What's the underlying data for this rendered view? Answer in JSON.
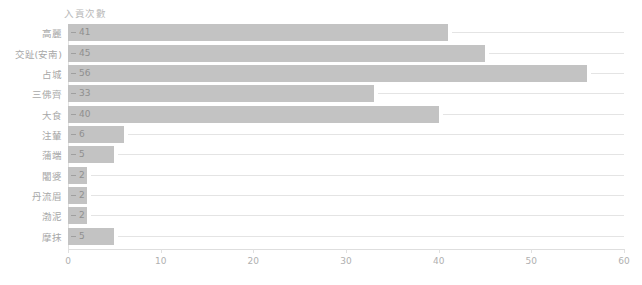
{
  "chart_data": {
    "type": "bar",
    "orientation": "horizontal",
    "title": "入貢次數",
    "xlabel": "",
    "ylabel": "",
    "xlim": [
      0,
      60
    ],
    "xticks": [
      0,
      10,
      20,
      30,
      40,
      50,
      60
    ],
    "grid": false,
    "legend": null,
    "bar_color": "#c3c3c3",
    "text_color": "#a8a8a8",
    "background": "#ffffff",
    "categories": [
      "高麗",
      "交趾(安南)",
      "占城",
      "三佛齊",
      "大食",
      "注輦",
      "蒲端",
      "闍婆",
      "丹流眉",
      "渤泥",
      "摩抹"
    ],
    "values": [
      41,
      45,
      56,
      33,
      40,
      6,
      5,
      2,
      2,
      2,
      5
    ],
    "labels": [
      "41",
      "45",
      "56",
      "33",
      "40",
      "6",
      "5",
      "2",
      "2",
      "2",
      "5"
    ]
  },
  "axis": {
    "tick_labels": [
      "0",
      "10",
      "20",
      "30",
      "40",
      "50",
      "60"
    ]
  }
}
